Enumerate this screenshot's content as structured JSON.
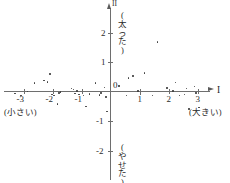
{
  "axes": {
    "x_name": "I",
    "y_name": "II",
    "x_ticks": [
      {
        "value": -3,
        "label": "-3"
      },
      {
        "value": -2,
        "label": "-2"
      },
      {
        "value": -1,
        "label": "-1"
      },
      {
        "value": 1,
        "label": "1"
      },
      {
        "value": 2,
        "label": "2"
      },
      {
        "value": 3,
        "label": "3"
      }
    ],
    "y_ticks": [
      {
        "value": 2,
        "label": "2"
      },
      {
        "value": 1,
        "label": "1"
      },
      {
        "value": -1,
        "label": "-1"
      },
      {
        "value": -2,
        "label": "-2"
      }
    ],
    "origin_label": "0"
  },
  "annotations": {
    "left": "(小さい)",
    "right": "(大きい)",
    "top": "(太った)",
    "bottom": "(やせた)"
  },
  "chart_data": {
    "type": "scatter",
    "title": "",
    "xlabel": "I",
    "ylabel": "II",
    "xlim": [
      -3.6,
      3.4
    ],
    "ylim": [
      -2.6,
      2.6
    ],
    "grid": false,
    "legend": "none",
    "x_axis_annotations": {
      "negative_end": "(小さい)",
      "positive_end": "(大きい)"
    },
    "y_axis_annotations": {
      "positive_end": "(太った)",
      "negative_end": "(やせた)"
    },
    "points": [
      [
        -3.3,
        -0.07
      ],
      [
        -3.08,
        -0.13
      ],
      [
        -2.87,
        0.0
      ],
      [
        -2.62,
        0.28
      ],
      [
        -2.3,
        0.37
      ],
      [
        -2.18,
        0.32
      ],
      [
        -2.08,
        0.6
      ],
      [
        -2.02,
        -0.1
      ],
      [
        -1.95,
        -0.13
      ],
      [
        -1.82,
        -0.43
      ],
      [
        -1.77,
        -0.05
      ],
      [
        -1.72,
        -0.02
      ],
      [
        -1.35,
        0.1
      ],
      [
        -1.28,
        0.07
      ],
      [
        -1.22,
        -0.07
      ],
      [
        -1.15,
        0.02
      ],
      [
        -1.08,
        -0.1
      ],
      [
        -0.93,
        -0.13
      ],
      [
        -0.85,
        -0.5
      ],
      [
        -0.72,
        -0.08
      ],
      [
        -0.52,
        0.28
      ],
      [
        -0.38,
        -0.12
      ],
      [
        -0.33,
        -0.05
      ],
      [
        -0.2,
        0.13
      ],
      [
        -0.15,
        -0.18
      ],
      [
        -0.12,
        -0.68
      ],
      [
        0.3,
        0.18
      ],
      [
        0.55,
        -0.13
      ],
      [
        0.62,
        0.45
      ],
      [
        0.78,
        0.53
      ],
      [
        0.95,
        0.02
      ],
      [
        1.03,
        -0.1
      ],
      [
        1.18,
        0.62
      ],
      [
        1.45,
        -0.13
      ],
      [
        1.62,
        1.68
      ],
      [
        1.95,
        0.12
      ],
      [
        2.15,
        0.02
      ],
      [
        2.25,
        0.3
      ],
      [
        2.38,
        -0.13
      ],
      [
        2.55,
        -0.1
      ],
      [
        2.62,
        0.1
      ],
      [
        2.7,
        -0.6
      ],
      [
        2.9,
        0.17
      ],
      [
        2.95,
        -0.05
      ],
      [
        3.05,
        -0.55
      ]
    ]
  }
}
